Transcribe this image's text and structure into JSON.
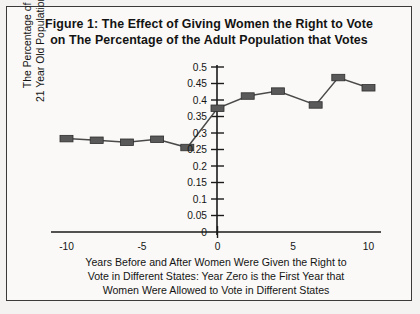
{
  "figure": {
    "title_line1": "Figure 1: The Effect of Giving Women the Right to Vote",
    "title_line2": "on The Percentage of the Adult Population that Votes",
    "y_axis_title_line1": "The Percentage of the Over",
    "y_axis_title_line2": "21 Year Old Population that Voted",
    "x_caption_line1": "Years Before and After Women Were Given the Right to",
    "x_caption_line2": "Vote in Different States: Year Zero is the First Year that",
    "x_caption_line3": "Women Were Allowed to Vote in Different States",
    "line_color": "#4a4a4a",
    "marker_color": "#595959",
    "axis_color": "#1a1a1a",
    "frame_color": "#3a3a3a",
    "background_color": "#faf9f7"
  },
  "chart_data": {
    "type": "line",
    "title": "Figure 1: The Effect of Giving Women the Right to Vote on The Percentage of the Adult Population that Votes",
    "xlabel": "Years Before and After Women Were Given the Right to Vote in Different States: Year Zero is the First Year that Women Were Allowed to Vote in Different States",
    "ylabel": "The Percentage of the Over 21 Year Old Population that Voted",
    "xlim": [
      -10,
      10
    ],
    "ylim": [
      0,
      0.5
    ],
    "grid": false,
    "legend": "none",
    "marker": "square",
    "xticks": [
      -10,
      -5,
      0,
      5,
      10
    ],
    "xtick_labels": [
      "-10",
      "-5",
      "0",
      "5",
      "10"
    ],
    "yticks": [
      0,
      0.05,
      0.1,
      0.15,
      0.2,
      0.25,
      0.3,
      0.35,
      0.4,
      0.45,
      0.5
    ],
    "ytick_labels": [
      "0",
      "0.05",
      "0.1",
      "0.15",
      "0.2",
      "0.25",
      "0.3",
      "0.35",
      "0.4",
      "0.45",
      "0.5"
    ],
    "series": [
      {
        "name": "Before the right to vote",
        "x": [
          -10,
          -8,
          -6,
          -4,
          -2
        ],
        "values": [
          0.283,
          0.278,
          0.272,
          0.281,
          0.256
        ]
      },
      {
        "name": "After the right to vote",
        "x": [
          0,
          2,
          4,
          6.5,
          8,
          10
        ],
        "values": [
          0.375,
          0.412,
          0.427,
          0.385,
          0.468,
          0.437
        ]
      }
    ]
  }
}
